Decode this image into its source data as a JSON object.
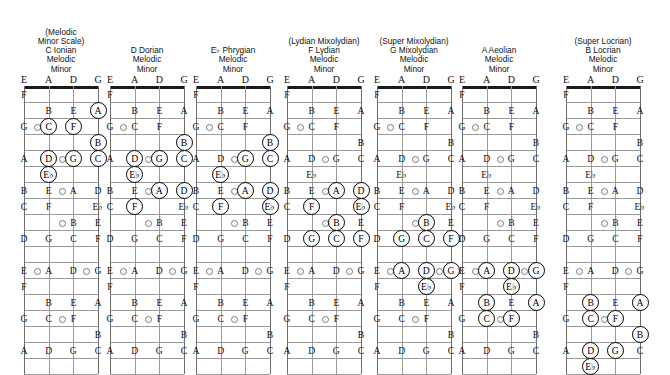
{
  "meta": {
    "instrument": "bass-guitar",
    "tuning": [
      "E",
      "A",
      "D",
      "G"
    ],
    "fret_count": 16,
    "ring_color": "#000000",
    "grid_color": "#9a9a9a",
    "nut_color": "#1a1a1a"
  },
  "fret_markers": [
    {
      "fret": 3,
      "string_gap": 0
    },
    {
      "fret": 5,
      "string_gap": 1
    },
    {
      "fret": 7,
      "string_gap": 1
    },
    {
      "fret": 9,
      "string_gap": 1
    },
    {
      "fret": 12,
      "string_gap": 0
    },
    {
      "fret": 12,
      "string_gap": 2
    },
    {
      "fret": 15,
      "string_gap": 1
    }
  ],
  "fretboard_notes": [
    {
      "fret": 1,
      "notes": [
        "F",
        "",
        "",
        ""
      ]
    },
    {
      "fret": 2,
      "notes": [
        "",
        "B",
        "E",
        "A"
      ]
    },
    {
      "fret": 3,
      "notes": [
        "G",
        "C",
        "F",
        ""
      ]
    },
    {
      "fret": 4,
      "notes": [
        "",
        "",
        "",
        "B"
      ]
    },
    {
      "fret": 5,
      "notes": [
        "A",
        "D",
        "G",
        "C"
      ]
    },
    {
      "fret": 6,
      "notes": [
        "",
        "E♭",
        "",
        ""
      ]
    },
    {
      "fret": 7,
      "notes": [
        "B",
        "E",
        "A",
        "D"
      ]
    },
    {
      "fret": 8,
      "notes": [
        "C",
        "F",
        "",
        "E♭"
      ]
    },
    {
      "fret": 9,
      "notes": [
        "",
        "",
        "B",
        "E"
      ]
    },
    {
      "fret": 10,
      "notes": [
        "D",
        "G",
        "C",
        "F"
      ]
    },
    {
      "fret": 11,
      "notes": [
        "",
        "",
        "",
        ""
      ]
    },
    {
      "fret": 12,
      "notes": [
        "E",
        "A",
        "D",
        "G"
      ]
    },
    {
      "fret": 13,
      "notes": [
        "F",
        "",
        "",
        ""
      ]
    },
    {
      "fret": 14,
      "notes": [
        "",
        "B",
        "E",
        "A"
      ]
    },
    {
      "fret": 15,
      "notes": [
        "G",
        "C",
        "F",
        ""
      ]
    },
    {
      "fret": 16,
      "notes": [
        "",
        "",
        "",
        "B"
      ]
    },
    {
      "fret": 17,
      "notes": [
        "A",
        "D",
        "G",
        "C"
      ]
    },
    {
      "fret": 18,
      "notes": [
        "",
        "",
        "",
        ""
      ]
    }
  ],
  "diagrams": [
    {
      "id": "c-ionian",
      "paren": "(Melodic",
      "paren2": "Minor Scale)",
      "root": "C Ionian",
      "line3": "Melodic",
      "line4": "Minor",
      "highlights": [
        {
          "fret": 2,
          "string": 3,
          "label": "A"
        },
        {
          "fret": 3,
          "string": 1,
          "label": "C"
        },
        {
          "fret": 3,
          "string": 2,
          "label": "F"
        },
        {
          "fret": 4,
          "string": 3,
          "label": "B"
        },
        {
          "fret": 5,
          "string": 1,
          "label": "D"
        },
        {
          "fret": 5,
          "string": 2,
          "label": "G"
        },
        {
          "fret": 5,
          "string": 3,
          "label": "C"
        },
        {
          "fret": 6,
          "string": 1,
          "label": "E♭"
        }
      ]
    },
    {
      "id": "d-dorian",
      "paren": "",
      "paren2": "",
      "root": "D Dorian",
      "line3": "Melodic",
      "line4": "Minor",
      "highlights": [
        {
          "fret": 4,
          "string": 3,
          "label": "B"
        },
        {
          "fret": 5,
          "string": 1,
          "label": "D"
        },
        {
          "fret": 5,
          "string": 2,
          "label": "G"
        },
        {
          "fret": 5,
          "string": 3,
          "label": "C"
        },
        {
          "fret": 6,
          "string": 1,
          "label": "E♭"
        },
        {
          "fret": 7,
          "string": 2,
          "label": "A"
        },
        {
          "fret": 7,
          "string": 3,
          "label": "D"
        },
        {
          "fret": 8,
          "string": 1,
          "label": "F"
        }
      ]
    },
    {
      "id": "eb-phrygian",
      "paren": "",
      "paren2": "",
      "root": "E♭ Phrygian",
      "line3": "Melodic",
      "line4": "Minor",
      "highlights": [
        {
          "fret": 4,
          "string": 3,
          "label": "B"
        },
        {
          "fret": 5,
          "string": 2,
          "label": "G"
        },
        {
          "fret": 5,
          "string": 3,
          "label": "C"
        },
        {
          "fret": 6,
          "string": 1,
          "label": "E♭"
        },
        {
          "fret": 7,
          "string": 2,
          "label": "A"
        },
        {
          "fret": 7,
          "string": 3,
          "label": "D"
        },
        {
          "fret": 8,
          "string": 1,
          "label": "F"
        },
        {
          "fret": 8,
          "string": 3,
          "label": "E♭"
        }
      ]
    },
    {
      "id": "f-lydian",
      "paren": "(Lydian Mixolydian)",
      "paren2": "",
      "root": "F Lydian",
      "line3": "Melodic",
      "line4": "Minor",
      "highlights": [
        {
          "fret": 7,
          "string": 2,
          "label": "A"
        },
        {
          "fret": 7,
          "string": 3,
          "label": "D"
        },
        {
          "fret": 8,
          "string": 1,
          "label": "F"
        },
        {
          "fret": 8,
          "string": 3,
          "label": "E♭"
        },
        {
          "fret": 9,
          "string": 2,
          "label": "B"
        },
        {
          "fret": 10,
          "string": 1,
          "label": "G"
        },
        {
          "fret": 10,
          "string": 2,
          "label": "C"
        },
        {
          "fret": 10,
          "string": 3,
          "label": "F"
        }
      ]
    },
    {
      "id": "g-mixolydian",
      "paren": "(Super Mixolydian)",
      "paren2": "",
      "root": "G Mixolydian",
      "line3": "Melodic",
      "line4": "Minor",
      "highlights": [
        {
          "fret": 9,
          "string": 2,
          "label": "B"
        },
        {
          "fret": 10,
          "string": 1,
          "label": "G"
        },
        {
          "fret": 10,
          "string": 2,
          "label": "C"
        },
        {
          "fret": 10,
          "string": 3,
          "label": "F"
        },
        {
          "fret": 12,
          "string": 1,
          "label": "A"
        },
        {
          "fret": 12,
          "string": 2,
          "label": "D"
        },
        {
          "fret": 12,
          "string": 3,
          "label": "G"
        },
        {
          "fret": 13,
          "string": 2,
          "label": "E♭"
        }
      ]
    },
    {
      "id": "a-aeolian",
      "paren": "",
      "paren2": "",
      "root": "A Aeolian",
      "line3": "Melodic",
      "line4": "Minor",
      "highlights": [
        {
          "fret": 12,
          "string": 1,
          "label": "A"
        },
        {
          "fret": 12,
          "string": 2,
          "label": "D"
        },
        {
          "fret": 12,
          "string": 3,
          "label": "G"
        },
        {
          "fret": 13,
          "string": 2,
          "label": "E♭"
        },
        {
          "fret": 14,
          "string": 1,
          "label": "B"
        },
        {
          "fret": 14,
          "string": 3,
          "label": "A"
        },
        {
          "fret": 15,
          "string": 1,
          "label": "C"
        },
        {
          "fret": 15,
          "string": 2,
          "label": "F"
        }
      ]
    },
    {
      "id": "b-locrian",
      "paren": "(Super Locrian)",
      "paren2": "",
      "root": "B Locrian",
      "line3": "Melodic",
      "line4": "Minor",
      "highlights": [
        {
          "fret": 14,
          "string": 1,
          "label": "B"
        },
        {
          "fret": 14,
          "string": 3,
          "label": "A"
        },
        {
          "fret": 15,
          "string": 1,
          "label": "C"
        },
        {
          "fret": 15,
          "string": 2,
          "label": "F"
        },
        {
          "fret": 16,
          "string": 3,
          "label": "B"
        },
        {
          "fret": 17,
          "string": 1,
          "label": "D"
        },
        {
          "fret": 17,
          "string": 2,
          "label": "G"
        },
        {
          "fret": 18,
          "string": 1,
          "label": "E♭"
        }
      ]
    }
  ]
}
